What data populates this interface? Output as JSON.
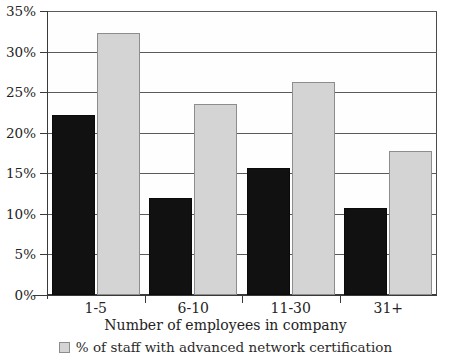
{
  "chart_data": {
    "type": "bar",
    "title": "",
    "subtitle": "",
    "xlabel": "Number of employees in company",
    "ylabel": "",
    "categories": [
      "1-5",
      "6-10",
      "11-30",
      "31+"
    ],
    "series": [
      {
        "name": "dark-series",
        "label": "",
        "color": "#111111",
        "values": [
          22.2,
          11.9,
          15.7,
          10.7
        ]
      },
      {
        "name": "light-series",
        "label": "% of staff with advanced network certification",
        "color": "#d4d4d4",
        "values": [
          32.3,
          23.5,
          26.2,
          17.7
        ]
      }
    ],
    "ylim": [
      0,
      35
    ],
    "ytick_step": 5,
    "ytick_labels": [
      "0%",
      "5%",
      "10%",
      "15%",
      "20%",
      "25%",
      "30%",
      "35%"
    ],
    "ytick_values": [
      0,
      5,
      10,
      15,
      20,
      25,
      30,
      35
    ],
    "grid": true,
    "grid_axis": "y",
    "legend_position": "bottom",
    "legend_entries": [
      {
        "swatch_color": "#d4d4d4",
        "label": "% of staff with advanced network certification"
      }
    ]
  },
  "colors": {
    "dark_bar": "#111111",
    "light_bar": "#d4d4d4",
    "axis": "#3a3a3a",
    "gridline": "#5a5a5a",
    "background": "#ffffff",
    "text": "#232323"
  }
}
